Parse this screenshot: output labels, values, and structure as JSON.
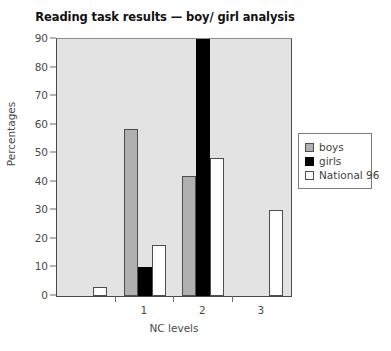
{
  "chart_data": {
    "type": "bar",
    "title": "Reading task results — boy/ girl analysis",
    "xlabel": "NC levels",
    "ylabel": "Percentages",
    "categories": [
      "",
      "1",
      "2",
      "3"
    ],
    "ylim": [
      0,
      90
    ],
    "yticks": [
      0,
      10,
      20,
      30,
      40,
      50,
      60,
      70,
      80,
      90
    ],
    "xticklabels": [
      "1",
      "2",
      "3"
    ],
    "grid": false,
    "legend_position": "right",
    "series": [
      {
        "name": "boys",
        "color": "#b0b0b0",
        "values": [
          0,
          58.5,
          42,
          0
        ]
      },
      {
        "name": "girls",
        "color": "#000000",
        "values": [
          0,
          10,
          90,
          0
        ]
      },
      {
        "name": "National 96",
        "color": "#ffffff",
        "values": [
          3,
          18,
          48.5,
          30
        ]
      }
    ]
  },
  "legend": {
    "entries": [
      {
        "label": "boys"
      },
      {
        "label": "girls"
      },
      {
        "label": "National 96"
      }
    ]
  }
}
